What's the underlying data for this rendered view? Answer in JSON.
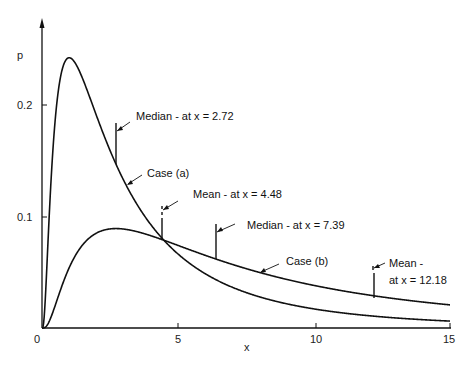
{
  "chart_data": {
    "type": "line",
    "title": "",
    "xlabel": "x",
    "ylabel": "p",
    "xlim": [
      0,
      15
    ],
    "ylim": [
      0,
      0.25
    ],
    "x_ticks": [
      "0",
      "5",
      "10",
      "15"
    ],
    "y_ticks": [
      "0.1",
      "0.2"
    ],
    "grid": false,
    "legend": "none (inline curve labels)",
    "series": [
      {
        "name": "Case (a)",
        "distribution": "lognormal",
        "mu": 1,
        "sigma": 1,
        "mode_x": 1.0,
        "peak_p": 0.242,
        "x": [
          0.5,
          1,
          2,
          2.72,
          3,
          4,
          4.48,
          5,
          7.39,
          10,
          12.18,
          15
        ],
        "values": [
          0.2,
          0.242,
          0.186,
          0.147,
          0.131,
          0.088,
          0.078,
          0.067,
          0.039,
          0.021,
          0.014,
          0.007
        ]
      },
      {
        "name": "Case (b)",
        "distribution": "lognormal",
        "mu": 2,
        "sigma": 1,
        "mode_x": 2.72,
        "peak_p": 0.088,
        "x": [
          0.5,
          1,
          2,
          2.72,
          3,
          4,
          4.48,
          5,
          7.39,
          10,
          12.18,
          15
        ],
        "values": [
          0.01,
          0.054,
          0.086,
          0.088,
          0.087,
          0.081,
          0.078,
          0.073,
          0.054,
          0.038,
          0.029,
          0.02
        ]
      }
    ],
    "annotations": [
      {
        "text": "Median - at x = 2.72",
        "series": "Case (a)",
        "x": 2.72
      },
      {
        "text": "Mean - at x = 4.48",
        "series": "Case (a)",
        "x": 4.48
      },
      {
        "text": "Median - at x = 7.39",
        "series": "Case (b)",
        "x": 7.39
      },
      {
        "text": "Mean - at x = 12.18",
        "series": "Case (b)",
        "x": 12.18
      }
    ]
  },
  "axes": {
    "ylabel": "p",
    "xlabel": "x",
    "origin_label": "0",
    "x_tick_labels": [
      "5",
      "10",
      "15"
    ],
    "y_tick_labels": [
      "0.2",
      "0.1"
    ]
  },
  "labels": {
    "case_a": "Case (a)",
    "case_b": "Case (b)",
    "median_a": "Median - at x = 2.72",
    "mean_a": "Mean - at x = 4.48",
    "median_b": "Median - at x = 7.39",
    "mean_b_line1": "Mean -",
    "mean_b_line2": "at x = 12.18"
  },
  "colors": {
    "line": "#111111",
    "background": "#ffffff"
  }
}
